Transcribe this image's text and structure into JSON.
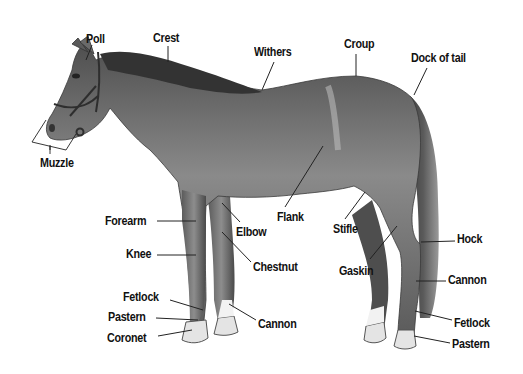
{
  "diagram": {
    "colors": {
      "background": "#ffffff",
      "label_text": "#111111",
      "leader_line": "#222222",
      "coat": "#6f6f6f",
      "mane_tail": "#3a3a3a",
      "hoof": "#d8d8d8"
    },
    "labels": [
      {
        "id": "poll",
        "text": "Poll",
        "x": 86,
        "y": 32,
        "line": [
          [
            92,
            45
          ],
          [
            86,
            60
          ]
        ]
      },
      {
        "id": "crest",
        "text": "Crest",
        "x": 153,
        "y": 31,
        "line": [
          [
            168,
            46
          ],
          [
            168,
            62
          ]
        ]
      },
      {
        "id": "withers",
        "text": "Withers",
        "x": 254,
        "y": 45,
        "line": [
          [
            274,
            62
          ],
          [
            262,
            90
          ]
        ]
      },
      {
        "id": "croup",
        "text": "Croup",
        "x": 344,
        "y": 37,
        "line": [
          [
            356,
            54
          ],
          [
            356,
            76
          ]
        ]
      },
      {
        "id": "dock-of-tail",
        "text": "Dock of tail",
        "x": 411,
        "y": 51,
        "line": [
          [
            427,
            68
          ],
          [
            414,
            95
          ]
        ]
      },
      {
        "id": "muzzle",
        "text": "Muzzle",
        "x": 40,
        "y": 156,
        "line": [
          [
            50,
            150
          ],
          [
            50,
            145
          ]
        ]
      },
      {
        "id": "forearm",
        "text": "Forearm",
        "x": 105,
        "y": 214,
        "line": [
          [
            157,
            221
          ],
          [
            196,
            221
          ]
        ]
      },
      {
        "id": "elbow",
        "text": "Elbow",
        "x": 236,
        "y": 225,
        "line": [
          [
            240,
            222
          ],
          [
            222,
            203
          ]
        ]
      },
      {
        "id": "flank",
        "text": "Flank",
        "x": 277,
        "y": 210,
        "line": [
          [
            285,
            207
          ],
          [
            323,
            146
          ]
        ]
      },
      {
        "id": "stifle",
        "text": "Stifle",
        "x": 333,
        "y": 222,
        "line": [
          [
            345,
            219
          ],
          [
            365,
            192
          ]
        ]
      },
      {
        "id": "knee",
        "text": "Knee",
        "x": 126,
        "y": 247,
        "line": [
          [
            157,
            255
          ],
          [
            196,
            255
          ]
        ]
      },
      {
        "id": "chestnut",
        "text": "Chestnut",
        "x": 253,
        "y": 260,
        "line": [
          [
            251,
            262
          ],
          [
            222,
            232
          ]
        ]
      },
      {
        "id": "gaskin",
        "text": "Gaskin",
        "x": 339,
        "y": 264,
        "line": [
          [
            370,
            259
          ],
          [
            397,
            226
          ]
        ]
      },
      {
        "id": "hock",
        "text": "Hock",
        "x": 457,
        "y": 232,
        "line": [
          [
            455,
            241
          ],
          [
            421,
            242
          ]
        ]
      },
      {
        "id": "cannon-hind",
        "text": "Cannon",
        "x": 448,
        "y": 273,
        "line": [
          [
            446,
            281
          ],
          [
            416,
            281
          ]
        ]
      },
      {
        "id": "fetlock-front",
        "text": "Fetlock",
        "x": 123,
        "y": 290,
        "line": [
          [
            170,
            300
          ],
          [
            203,
            310
          ]
        ]
      },
      {
        "id": "pastern-front",
        "text": "Pastern",
        "x": 108,
        "y": 310,
        "line": [
          [
            156,
            318
          ],
          [
            198,
            320
          ]
        ]
      },
      {
        "id": "cannon-front",
        "text": "Cannon",
        "x": 258,
        "y": 317,
        "line": [
          [
            256,
            320
          ],
          [
            229,
            304
          ]
        ]
      },
      {
        "id": "fetlock-hind",
        "text": "Fetlock",
        "x": 454,
        "y": 316,
        "line": [
          [
            452,
            320
          ],
          [
            415,
            311
          ]
        ]
      },
      {
        "id": "coronet",
        "text": "Coronet",
        "x": 107,
        "y": 331,
        "line": [
          [
            158,
            336
          ],
          [
            192,
            330
          ]
        ]
      },
      {
        "id": "pastern-hind",
        "text": "Pastern",
        "x": 452,
        "y": 337,
        "line": [
          [
            450,
            343
          ],
          [
            414,
            336
          ]
        ]
      }
    ]
  }
}
